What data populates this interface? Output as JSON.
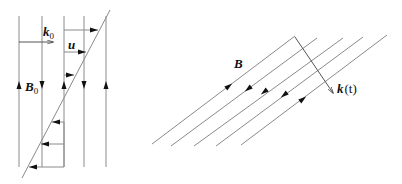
{
  "left_figure": {
    "labels": {
      "k": "k",
      "k_sub": "0",
      "u": "u",
      "B": "B",
      "B_sub": "0"
    },
    "field_lines": [
      {
        "x": 19,
        "direction": "up"
      },
      {
        "x": 42,
        "direction": "down"
      },
      {
        "x": 64,
        "direction": "up"
      },
      {
        "x": 84,
        "direction": "down"
      },
      {
        "x": 106,
        "direction": "up"
      }
    ],
    "velocity_arrows": [
      {
        "y": 30,
        "direction": "right"
      },
      {
        "y": 52,
        "direction": "right"
      },
      {
        "y": 75,
        "direction": "right"
      },
      {
        "y": 122,
        "direction": "left"
      },
      {
        "y": 144,
        "direction": "left"
      },
      {
        "y": 167,
        "direction": "left"
      }
    ]
  },
  "right_figure": {
    "labels": {
      "B": "B",
      "k": "k",
      "k_arg": "(t)"
    },
    "field_lines": [
      {
        "direction": "up-right"
      },
      {
        "direction": "down-left"
      },
      {
        "direction": "down-left"
      },
      {
        "direction": "down-left"
      },
      {
        "direction": "up-right"
      }
    ]
  },
  "colors": {
    "line": "#8a8a8a",
    "arrow": "#111111",
    "text": "#111111"
  }
}
